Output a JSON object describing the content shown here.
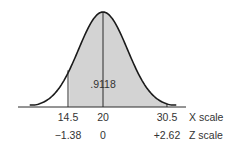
{
  "chart_data": {
    "type": "area",
    "title": "",
    "distribution": {
      "mean": 20,
      "z_mean": 0
    },
    "shaded_region": {
      "x_from": 14.5,
      "x_to": 30.5,
      "z_from": -1.38,
      "z_to": 2.62,
      "area": 0.9118
    },
    "area_label": ".9118",
    "x_scale": {
      "label": "X scale",
      "ticks": [
        "14.5",
        "20",
        "30.5"
      ],
      "values": [
        14.5,
        20,
        30.5
      ]
    },
    "z_scale": {
      "label": "Z scale",
      "ticks": [
        "−1.38",
        "0",
        "+2.62"
      ],
      "values": [
        -1.38,
        0,
        2.62
      ]
    },
    "colors": {
      "fill": "#d3d3d3",
      "curve": "#1a1a1a",
      "axis": "#2a2a2a"
    },
    "grid": false,
    "legend": null
  }
}
